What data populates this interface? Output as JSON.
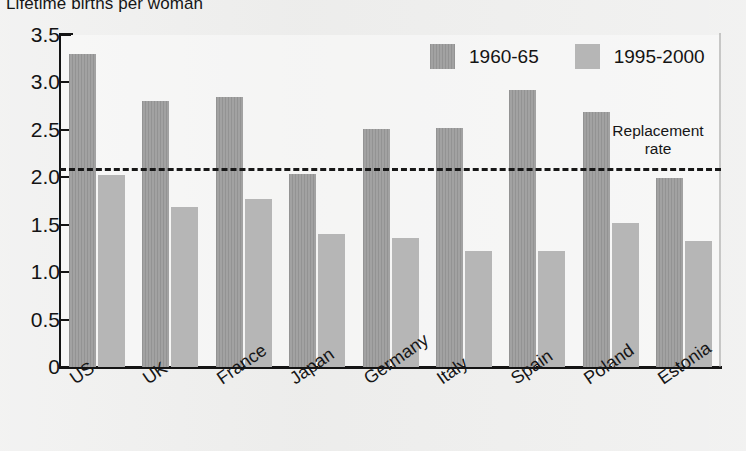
{
  "chart_data": {
    "type": "bar",
    "title": "Lifetime births per woman",
    "xlabel": "",
    "ylabel": "",
    "ylim": [
      0,
      3.5
    ],
    "yticks": [
      "0",
      "0.5",
      "1.0",
      "1.5",
      "2.0",
      "2.5",
      "3.0",
      "3.5"
    ],
    "ytick_values": [
      0,
      0.5,
      1.0,
      1.5,
      2.0,
      2.5,
      3.0,
      3.5
    ],
    "grid": false,
    "legend_position": "top-right",
    "categories": [
      "US",
      "UK",
      "France",
      "Japan",
      "Germany",
      "Italy",
      "Spain",
      "Poland",
      "Estonia"
    ],
    "series": [
      {
        "name": "1960-65",
        "color": "#9a9a9a",
        "values": [
          3.3,
          2.8,
          2.85,
          2.03,
          2.51,
          2.52,
          2.92,
          2.69,
          1.99
        ]
      },
      {
        "name": "1995-2000",
        "color": "#b6b6b6",
        "values": [
          2.02,
          1.69,
          1.77,
          1.4,
          1.36,
          1.22,
          1.22,
          1.52,
          1.33
        ]
      }
    ],
    "annotations": [
      {
        "id": "replacement-rate",
        "label_line1": "Replacement",
        "label_line2": "rate",
        "value": 2.1,
        "style": "dashed-horizontal-line",
        "color": "#181818"
      }
    ]
  },
  "legend": {
    "items": [
      {
        "label": "1960-65",
        "swatch": "old"
      },
      {
        "label": "1995-2000",
        "swatch": "new"
      }
    ]
  }
}
